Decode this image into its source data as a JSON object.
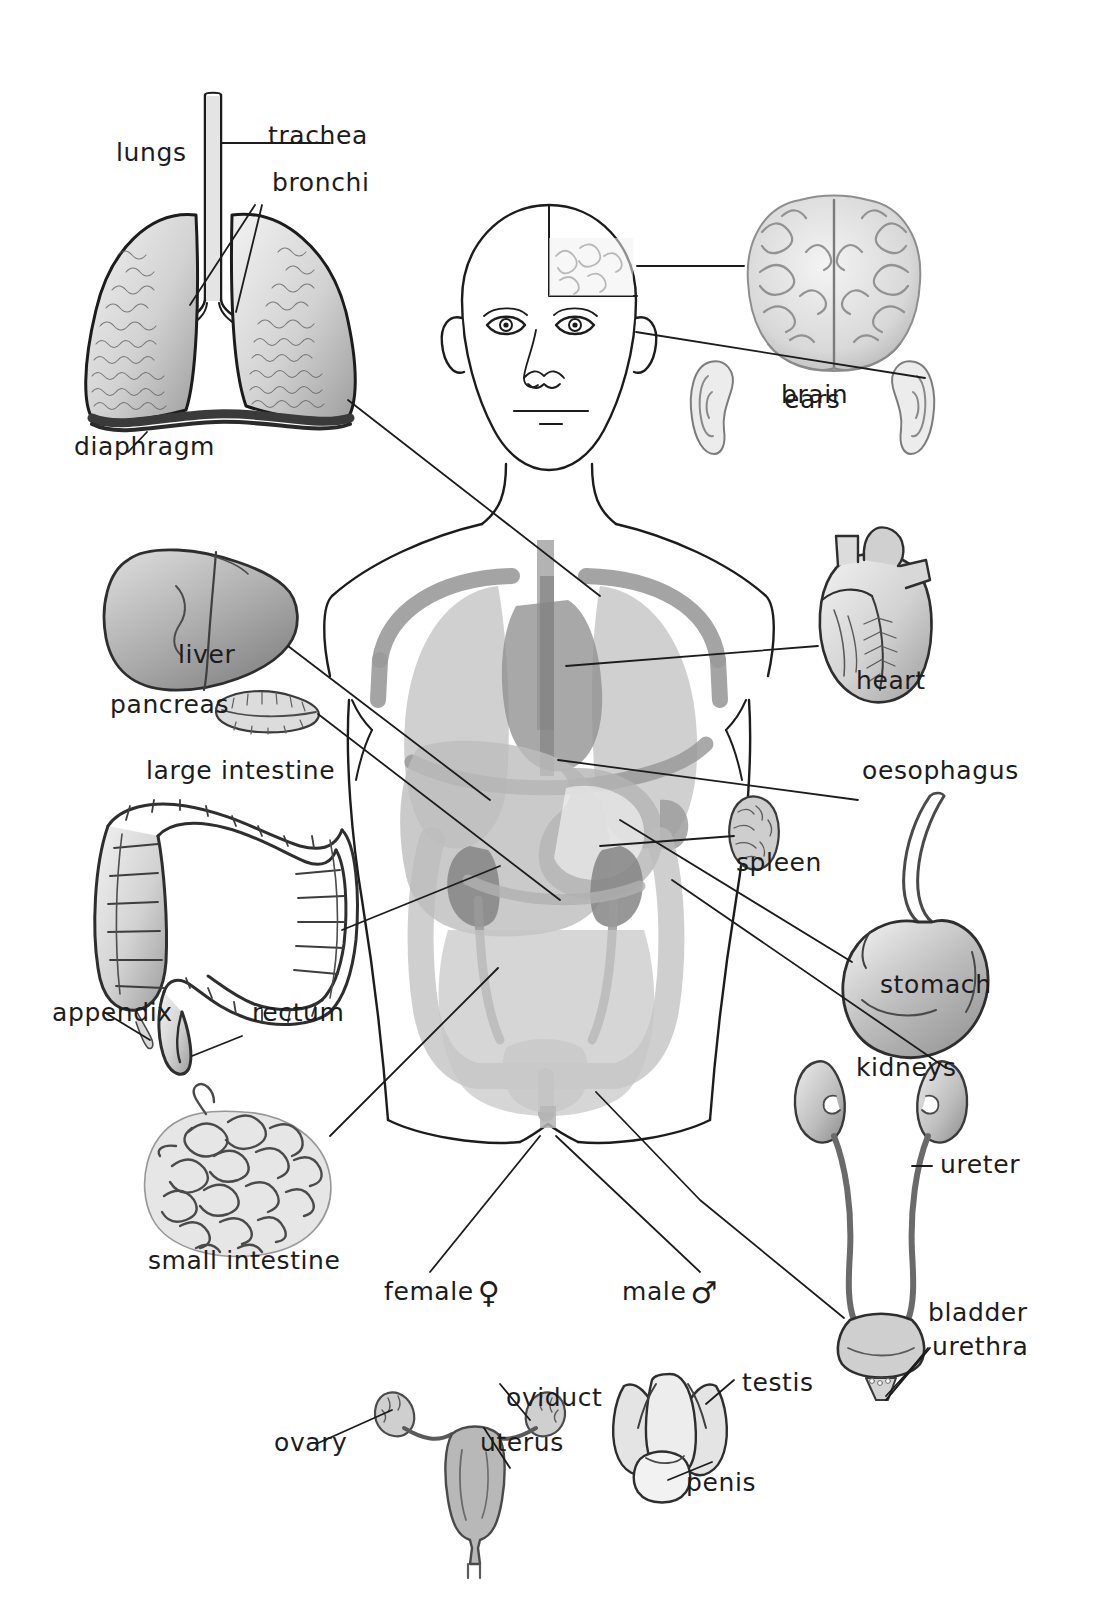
{
  "diagram": {
    "background": "#ffffff",
    "ink": "#1c1c1c",
    "organ_fill_light": "#cfcfcf",
    "organ_fill_mid": "#a9a9a9",
    "organ_fill_dark": "#8d8d8d",
    "vessel_grey": "#9a9a9a"
  },
  "labels": {
    "lungs": "lungs",
    "trachea": "trachea",
    "bronchi": "bronchi",
    "diaphragm": "diaphragm",
    "brain": "brain",
    "ears": "ears",
    "heart": "heart",
    "liver": "liver",
    "pancreas": "pancreas",
    "large_intestine": "large intestine",
    "appendix": "appendix",
    "rectum": "rectum",
    "small_intestine": "small intestine",
    "oesophagus": "oesophagus",
    "spleen": "spleen",
    "stomach": "stomach",
    "kidneys": "kidneys",
    "ureter": "ureter",
    "bladder": "bladder",
    "urethra": "urethra",
    "female": "female",
    "female_symbol": "♀",
    "ovary": "ovary",
    "oviduct": "oviduct",
    "uterus": "uterus",
    "male": "male",
    "male_symbol": "♂",
    "testis": "testis",
    "penis": "penis"
  },
  "organ_list": [
    "lungs",
    "trachea",
    "bronchi",
    "diaphragm",
    "brain",
    "ears",
    "heart",
    "liver",
    "pancreas",
    "large intestine",
    "appendix",
    "rectum",
    "small intestine",
    "oesophagus",
    "spleen",
    "stomach",
    "kidneys",
    "ureter",
    "bladder",
    "urethra",
    "ovary",
    "oviduct",
    "uterus",
    "testis",
    "penis"
  ]
}
